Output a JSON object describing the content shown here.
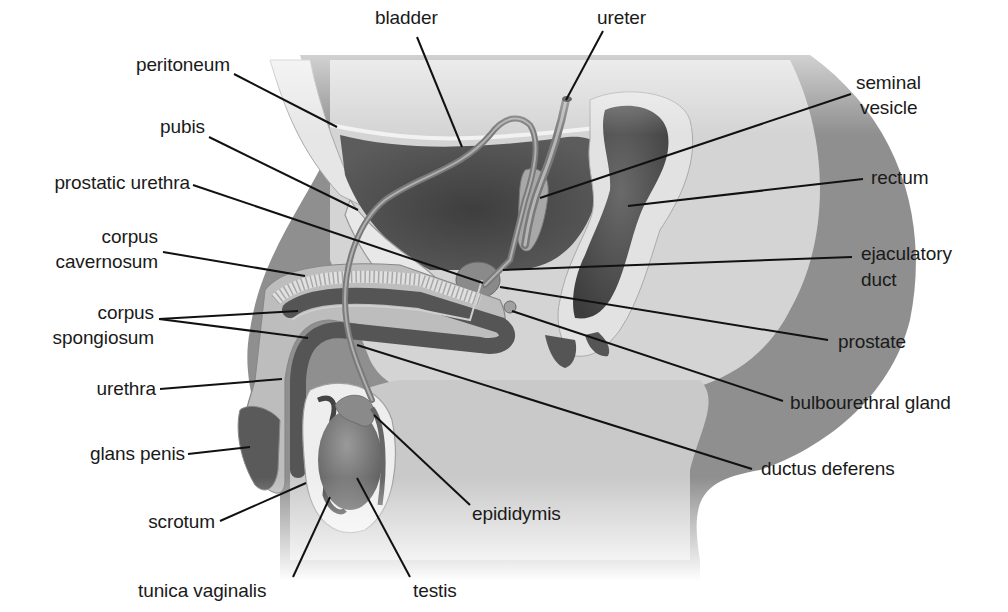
{
  "figure": {
    "colors": {
      "background": "#ffffff",
      "body_silhouette": "#8f8f8f",
      "body_light": "#d6d6d6",
      "pelvic_cavity": "#e4e4e4",
      "organ_dark": "#4a4a4a",
      "organ_mid": "#6e6e6e",
      "leader_line": "#111111",
      "label_text": "#1a1a1a"
    }
  },
  "labels": {
    "bladder": "bladder",
    "ureter": "ureter",
    "peritoneum": "peritoneum",
    "pubis": "pubis",
    "prostatic_urethra": "prostatic urethra",
    "corpus_cavernosum_1": "corpus",
    "corpus_cavernosum_2": "cavernosum",
    "corpus_spongiosum_1": "corpus",
    "corpus_spongiosum_2": "spongiosum",
    "urethra": "urethra",
    "glans_penis": "glans penis",
    "scrotum": "scrotum",
    "tunica_vaginalis": "tunica vaginalis",
    "testis": "testis",
    "epididymis": "epididymis",
    "ductus_deferens": "ductus deferens",
    "bulbourethral_gland": "bulbourethral gland",
    "prostate": "prostate",
    "ejaculatory_duct_1": "ejaculatory",
    "ejaculatory_duct_2": "duct",
    "rectum": "rectum",
    "seminal_vesicle_1": "seminal",
    "seminal_vesicle_2": "vesicle"
  }
}
